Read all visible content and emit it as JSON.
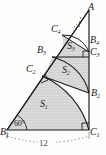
{
  "figure": {
    "name": "nested-right-triangle-spiral-with-arcs",
    "colors": {
      "stroke": "#1a1a1a",
      "fill": "#d9d9d9",
      "hatch": "#bfbfbf",
      "dimension": "#7a7a7a",
      "background": "#fdfdfc"
    },
    "vertices": [
      {
        "id": "A",
        "label": "A",
        "sub": "",
        "x": 90,
        "y": 9
      },
      {
        "id": "B1",
        "label": "B",
        "sub": "1",
        "x": 3,
        "y": 132
      },
      {
        "id": "C1",
        "label": "C",
        "sub": "1",
        "x": 90,
        "y": 132
      },
      {
        "id": "B2",
        "label": "B",
        "sub": "2",
        "x": 86,
        "y": 95
      },
      {
        "id": "C2",
        "label": "C",
        "sub": "2",
        "x": 38,
        "y": 71
      },
      {
        "id": "B3",
        "label": "B",
        "sub": "3",
        "x": 47,
        "y": 50
      },
      {
        "id": "C3",
        "label": "C",
        "sub": "3",
        "x": 85,
        "y": 54
      },
      {
        "id": "B4",
        "label": "B",
        "sub": "4",
        "x": 86,
        "y": 41
      },
      {
        "id": "C4",
        "label": "C",
        "sub": "4",
        "x": 58,
        "y": 30
      }
    ],
    "regions": [
      {
        "id": "S1",
        "label": "S",
        "sub": "1",
        "x": 40,
        "y": 104
      },
      {
        "id": "S2",
        "label": "S",
        "sub": "2",
        "x": 62,
        "y": 70
      },
      {
        "id": "S3",
        "label": "S",
        "sub": "3",
        "x": 69,
        "y": 46
      }
    ],
    "angle": {
      "label": "60",
      "unit": "°",
      "x": 15,
      "y": 126
    },
    "dimension": {
      "label": "12",
      "x": 43,
      "y": 144
    },
    "right_angle_markers": [
      "C1",
      "C2",
      "C3"
    ],
    "ellipsis": {
      "label": "⋰",
      "x": 79,
      "y": 23
    }
  }
}
